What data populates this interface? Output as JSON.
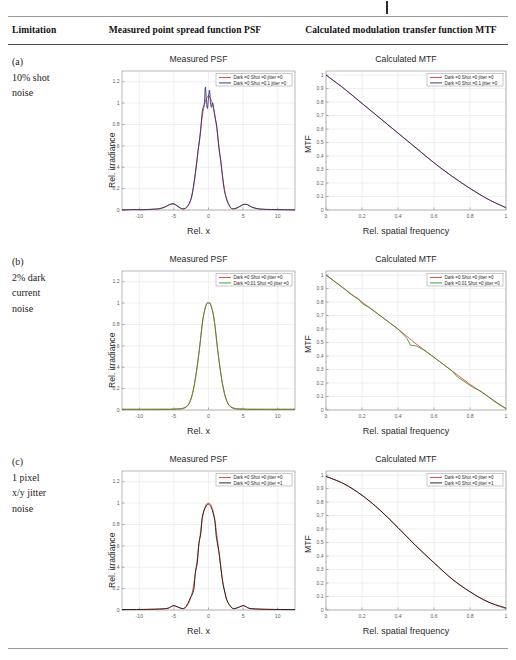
{
  "header": {
    "col_limitation": "Limitation",
    "col_psf": "Measured point spread function PSF",
    "col_mtf": "Calculated modulation transfer function MTF"
  },
  "axes": {
    "psf_title": "Measured PSF",
    "mtf_title": "Calculated MTF",
    "psf_xlabel": "Rel. x",
    "psf_ylabel": "Rel. irradiance",
    "mtf_xlabel": "Rel. spatial frequency",
    "mtf_ylabel": "MTF",
    "psf_xticks": [
      "-10",
      "-5",
      "0",
      "5",
      "10"
    ],
    "psf_yticks": [
      "0",
      "0.2",
      "0.4",
      "0.6",
      "0.8",
      "1",
      "1.2"
    ],
    "mtf_xticks": [
      "0",
      "0.2",
      "0.4",
      "0.6",
      "0.8",
      "1"
    ],
    "mtf_yticks": [
      "0",
      "0.1",
      "0.2",
      "0.3",
      "0.4",
      "0.5",
      "0.6",
      "0.7",
      "0.8",
      "0.9",
      "1"
    ],
    "psf_xlim": [
      -12.5,
      12.5
    ],
    "psf_ylim": [
      0,
      1.3
    ],
    "mtf_xlim": [
      0,
      1
    ],
    "mtf_ylim": [
      0,
      1.03
    ]
  },
  "colors": {
    "reference_red": "#d9433a",
    "shot_blue": "#1f2a6e",
    "dark_green": "#3d8f26",
    "jitter_black": "#111111",
    "grid": "#dedede",
    "frame": "#9b9b9b"
  },
  "rows": [
    {
      "tag": "(a)",
      "label_lines": [
        "(a)",
        "10% shot",
        "noise"
      ],
      "legend": [
        {
          "text": "Dark =0 Shot =0 jitter =0",
          "color": "#d9433a"
        },
        {
          "text": "Dark =0 Shot =0.1 jitter =0",
          "color": "#1f2a6e"
        }
      ]
    },
    {
      "tag": "(b)",
      "label_lines": [
        "(b)",
        "2% dark",
        "current",
        "noise"
      ],
      "legend": [
        {
          "text": "Dark =0 Shot =0 jitter =0",
          "color": "#d9433a"
        },
        {
          "text": "Dark =0.01 Shot =0 jitter =0",
          "color": "#3d8f26"
        }
      ]
    },
    {
      "tag": "(c)",
      "label_lines": [
        "(c)",
        "1 pixel",
        "x/y jitter",
        "noise"
      ],
      "legend": [
        {
          "text": "Dark =0 Shot =0 jitter =0",
          "color": "#d9433a"
        },
        {
          "text": "Dark =0 Shot =0 jitter =1",
          "color": "#111111"
        }
      ]
    }
  ],
  "chart_data": [
    {
      "id": "a-psf",
      "type": "line",
      "title": "Measured PSF",
      "xlabel": "Rel. x",
      "ylabel": "Rel. irradiance",
      "xlim": [
        -12.5,
        12.5
      ],
      "ylim": [
        0,
        1.3
      ],
      "grid": true,
      "legend_position": "upper right",
      "series": [
        {
          "name": "Dark =0 Shot =0 jitter =0",
          "color": "#d9433a",
          "x": [
            -12.5,
            -11,
            -9.5,
            -8,
            -7,
            -6.2,
            -5.6,
            -5.0,
            -4.4,
            -3.8,
            -3.2,
            -2.6,
            -2.2,
            -1.8,
            -1.5,
            -1.2,
            -0.9,
            -0.6,
            -0.3,
            0,
            0.3,
            0.6,
            0.9,
            1.2,
            1.5,
            1.8,
            2.2,
            2.6,
            3.2,
            3.8,
            4.4,
            5.0,
            5.6,
            6.2,
            7,
            8,
            9.5,
            11,
            12.5
          ],
          "y": [
            0,
            0.003,
            0.004,
            0.006,
            0.012,
            0.03,
            0.05,
            0.055,
            0.035,
            0.01,
            0.02,
            0.09,
            0.2,
            0.38,
            0.55,
            0.72,
            0.87,
            0.98,
            1.04,
            1.07,
            1.04,
            0.99,
            0.9,
            0.76,
            0.6,
            0.43,
            0.24,
            0.1,
            0.02,
            0.012,
            0.03,
            0.05,
            0.052,
            0.03,
            0.012,
            0.006,
            0.004,
            0.003,
            0
          ]
        },
        {
          "name": "Dark =0 Shot =0.1 jitter =0",
          "color": "#1f2a6e",
          "note": "same PSF with 10% shot noise; noisy double-peak reaching ~1.15",
          "x": [
            -12.5,
            -11,
            -9.5,
            -8,
            -7,
            -6.2,
            -5.6,
            -5.0,
            -4.4,
            -3.8,
            -3.2,
            -2.6,
            -2.2,
            -1.8,
            -1.5,
            -1.2,
            -0.9,
            -0.6,
            -0.45,
            -0.3,
            -0.15,
            0,
            0.15,
            0.3,
            0.45,
            0.6,
            0.9,
            1.2,
            1.5,
            1.8,
            2.2,
            2.6,
            3.2,
            3.8,
            4.4,
            5.0,
            5.6,
            6.2,
            7,
            8,
            9.5,
            11,
            12.5
          ],
          "y": [
            0,
            0.004,
            0.003,
            0.008,
            0.014,
            0.032,
            0.052,
            0.058,
            0.032,
            0.012,
            0.024,
            0.086,
            0.21,
            0.4,
            0.56,
            0.7,
            0.92,
            1.0,
            1.15,
            1.02,
            0.95,
            1.05,
            1.12,
            1.0,
            0.96,
            1.0,
            0.88,
            0.78,
            0.58,
            0.45,
            0.22,
            0.11,
            0.022,
            0.014,
            0.028,
            0.052,
            0.05,
            0.028,
            0.014,
            0.007,
            0.004,
            0.003,
            0
          ]
        }
      ]
    },
    {
      "id": "a-mtf",
      "type": "line",
      "title": "Calculated MTF",
      "xlabel": "Rel. spatial frequency",
      "ylabel": "MTF",
      "xlim": [
        0,
        1
      ],
      "ylim": [
        0,
        1.03
      ],
      "grid": true,
      "legend_position": "upper right",
      "series": [
        {
          "name": "Dark =0 Shot =0 jitter =0",
          "color": "#d9433a",
          "x": [
            0,
            0.1,
            0.2,
            0.3,
            0.4,
            0.5,
            0.6,
            0.7,
            0.8,
            0.9,
            1.0
          ],
          "y": [
            1.0,
            0.9,
            0.79,
            0.68,
            0.57,
            0.46,
            0.35,
            0.25,
            0.16,
            0.08,
            0.015
          ]
        },
        {
          "name": "Dark =0 Shot =0.1 jitter =0",
          "color": "#1f2a6e",
          "x": [
            0,
            0.1,
            0.2,
            0.3,
            0.4,
            0.5,
            0.6,
            0.7,
            0.8,
            0.9,
            1.0
          ],
          "y": [
            1.0,
            0.9,
            0.79,
            0.68,
            0.57,
            0.46,
            0.35,
            0.25,
            0.16,
            0.08,
            0.018
          ]
        }
      ]
    },
    {
      "id": "b-psf",
      "type": "line",
      "title": "Measured PSF",
      "xlabel": "Rel. x",
      "ylabel": "Rel. irradiance",
      "xlim": [
        -12.5,
        12.5
      ],
      "ylim": [
        0,
        1.3
      ],
      "grid": true,
      "legend_position": "upper right",
      "series": [
        {
          "name": "Dark =0 Shot =0 jitter =0",
          "color": "#d9433a",
          "x": [
            -12.5,
            -8,
            -5,
            -3.4,
            -2.6,
            -2.0,
            -1.4,
            -0.8,
            -0.3,
            0,
            0.3,
            0.8,
            1.4,
            2.0,
            2.6,
            3.4,
            5,
            8,
            12.5
          ],
          "y": [
            0.004,
            0.004,
            0.006,
            0.02,
            0.09,
            0.25,
            0.52,
            0.85,
            0.985,
            1.0,
            0.985,
            0.85,
            0.52,
            0.25,
            0.09,
            0.02,
            0.006,
            0.004,
            0.004
          ]
        },
        {
          "name": "Dark =0.01 Shot =0 jitter =0",
          "color": "#3d8f26",
          "x": [
            -12.5,
            -8,
            -5,
            -3.4,
            -2.6,
            -2.0,
            -1.4,
            -0.8,
            -0.3,
            0,
            0.3,
            0.8,
            1.4,
            2.0,
            2.6,
            3.4,
            5,
            8,
            12.5
          ],
          "y": [
            0.008,
            0.008,
            0.01,
            0.024,
            0.094,
            0.255,
            0.525,
            0.855,
            0.99,
            1.0,
            0.99,
            0.855,
            0.525,
            0.255,
            0.094,
            0.024,
            0.01,
            0.008,
            0.008
          ]
        }
      ]
    },
    {
      "id": "b-mtf",
      "type": "line",
      "title": "Calculated MTF",
      "xlabel": "Rel. spatial frequency",
      "ylabel": "MTF",
      "xlim": [
        0,
        1
      ],
      "ylim": [
        0,
        1.03
      ],
      "grid": true,
      "legend_position": "upper right",
      "note": "near-linear roll-off with jagged noise on the dark-current trace",
      "series": [
        {
          "name": "Dark =0 Shot =0 jitter =0",
          "color": "#d9433a",
          "x": [
            0,
            0.1,
            0.2,
            0.3,
            0.4,
            0.5,
            0.6,
            0.7,
            0.8,
            0.9,
            1.0
          ],
          "y": [
            1.0,
            0.9,
            0.8,
            0.7,
            0.6,
            0.49,
            0.39,
            0.29,
            0.19,
            0.1,
            0.01
          ]
        },
        {
          "name": "Dark =0.01 Shot =0 jitter =0",
          "color": "#3d8f26",
          "x": [
            0,
            0.05,
            0.1,
            0.15,
            0.18,
            0.2,
            0.25,
            0.3,
            0.35,
            0.4,
            0.45,
            0.47,
            0.5,
            0.55,
            0.6,
            0.65,
            0.7,
            0.73,
            0.78,
            0.82,
            0.86,
            0.9,
            0.95,
            1.0
          ],
          "y": [
            1.0,
            0.95,
            0.9,
            0.845,
            0.825,
            0.79,
            0.75,
            0.7,
            0.65,
            0.6,
            0.53,
            0.48,
            0.475,
            0.44,
            0.39,
            0.34,
            0.29,
            0.245,
            0.2,
            0.165,
            0.14,
            0.1,
            0.05,
            0.01
          ]
        }
      ]
    },
    {
      "id": "c-psf",
      "type": "line",
      "title": "Measured PSF",
      "xlabel": "Rel. x",
      "ylabel": "Rel. irradiance",
      "xlim": [
        -12.5,
        12.5
      ],
      "ylim": [
        0,
        1.3
      ],
      "grid": true,
      "legend_position": "upper right",
      "series": [
        {
          "name": "Dark =0 Shot =0 jitter =0",
          "color": "#d9433a",
          "x": [
            -12.5,
            -9,
            -6.2,
            -5.4,
            -5.0,
            -4.5,
            -3.6,
            -3.0,
            -2.4,
            -1.9,
            -1.4,
            -0.9,
            -0.45,
            0,
            0.45,
            0.9,
            1.4,
            1.9,
            2.4,
            3.0,
            3.6,
            4.5,
            5.0,
            5.4,
            6.2,
            9,
            12.5
          ],
          "y": [
            0.004,
            0.005,
            0.012,
            0.03,
            0.04,
            0.028,
            0.012,
            0.05,
            0.15,
            0.34,
            0.6,
            0.85,
            0.97,
            1.0,
            0.97,
            0.85,
            0.6,
            0.34,
            0.15,
            0.05,
            0.012,
            0.028,
            0.04,
            0.03,
            0.012,
            0.005,
            0.004
          ]
        },
        {
          "name": "Dark =0 Shot =0 jitter =1",
          "color": "#111111",
          "note": "1-pixel jitter produces staircase steps on the flanks",
          "x": [
            -12.5,
            -9,
            -6.2,
            -5.4,
            -5.0,
            -4.5,
            -3.6,
            -3.0,
            -2.6,
            -2.4,
            -2.1,
            -1.9,
            -1.6,
            -1.4,
            -1.1,
            -0.9,
            -0.45,
            0,
            0.45,
            0.9,
            1.1,
            1.4,
            1.6,
            1.9,
            2.1,
            2.4,
            2.6,
            3.0,
            3.6,
            4.5,
            5.0,
            5.4,
            6.2,
            9,
            12.5
          ],
          "y": [
            0.004,
            0.006,
            0.013,
            0.032,
            0.042,
            0.03,
            0.014,
            0.06,
            0.12,
            0.14,
            0.2,
            0.35,
            0.45,
            0.62,
            0.72,
            0.87,
            0.96,
            0.99,
            0.95,
            0.84,
            0.7,
            0.58,
            0.5,
            0.33,
            0.24,
            0.16,
            0.1,
            0.05,
            0.013,
            0.03,
            0.042,
            0.032,
            0.013,
            0.006,
            0.004
          ]
        }
      ]
    },
    {
      "id": "c-mtf",
      "type": "line",
      "title": "Calculated MTF",
      "xlabel": "Rel. spatial frequency",
      "ylabel": "MTF",
      "xlim": [
        0,
        1
      ],
      "ylim": [
        0,
        1.03
      ],
      "grid": true,
      "legend_position": "upper right",
      "series": [
        {
          "name": "Dark =0 Shot =0 jitter =0",
          "color": "#d9433a",
          "x": [
            0,
            0.1,
            0.2,
            0.3,
            0.4,
            0.5,
            0.6,
            0.7,
            0.8,
            0.9,
            1.0
          ],
          "y": [
            0.99,
            0.935,
            0.85,
            0.74,
            0.61,
            0.475,
            0.35,
            0.23,
            0.135,
            0.06,
            0.01
          ]
        },
        {
          "name": "Dark =0 Shot =0 jitter =1",
          "color": "#111111",
          "x": [
            0,
            0.1,
            0.2,
            0.3,
            0.4,
            0.5,
            0.6,
            0.7,
            0.8,
            0.9,
            1.0
          ],
          "y": [
            0.99,
            0.935,
            0.85,
            0.74,
            0.61,
            0.475,
            0.35,
            0.23,
            0.135,
            0.06,
            0.015
          ]
        }
      ]
    }
  ]
}
